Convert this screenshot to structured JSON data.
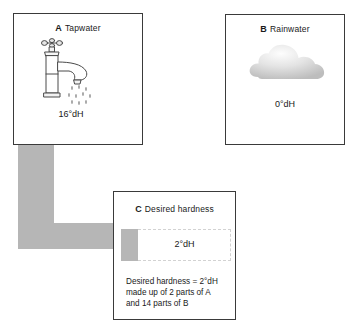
{
  "diagram": {
    "accent_grey": "#b6b6b6",
    "line_colour": "#3a3a3a"
  },
  "panels": {
    "a": {
      "letter": "A",
      "label": "Tapwater",
      "value": "16°dH",
      "icon": "tap-icon"
    },
    "b": {
      "letter": "B",
      "label": "Rainwater",
      "value": "0°dH",
      "icon": "cloud-icon"
    },
    "c": {
      "letter": "C",
      "label": "Desired hardness",
      "value": "2°dH",
      "caption": "Desired hardness = 2°dH\nmade up of 2 parts of A\nand 14 parts of B"
    }
  },
  "arrow": {
    "name": "flow-arrow-a-to-c",
    "from": "A",
    "to": "C"
  },
  "mixture": {
    "part_a_label": "2 parts of A",
    "part_b_label": "14 parts of B"
  }
}
